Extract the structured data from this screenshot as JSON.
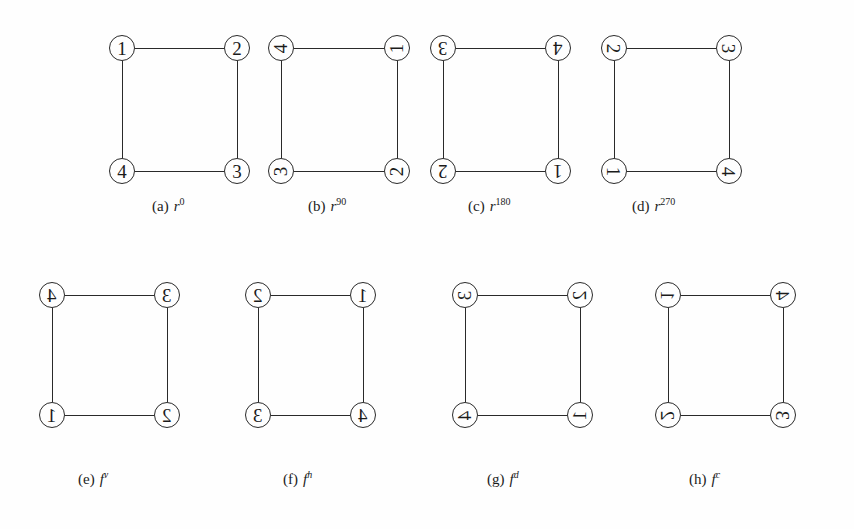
{
  "figure_set": {
    "description": "Eight labelled 4-cycle graphs showing the dihedral group D4 symmetries acting on a square's vertices",
    "node_diameter_px": 26,
    "line_color": "#2a2a2a",
    "background_color": "#fefefe",
    "text_color": "#1b1b1b"
  },
  "panels": [
    {
      "key": "a",
      "tag": "(a)",
      "symbol": "r",
      "exponent": "0",
      "exponent_italic": false,
      "orientation": "o-0",
      "nodes": {
        "tl": "1",
        "tr": "2",
        "bl": "4",
        "br": "3"
      }
    },
    {
      "key": "b",
      "tag": "(b)",
      "symbol": "r",
      "exponent": "90",
      "exponent_italic": false,
      "orientation": "o-90",
      "nodes": {
        "tl": "4",
        "tr": "1",
        "bl": "3",
        "br": "2"
      }
    },
    {
      "key": "c",
      "tag": "(c)",
      "symbol": "r",
      "exponent": "180",
      "exponent_italic": false,
      "orientation": "o-180",
      "nodes": {
        "tl": "3",
        "tr": "4",
        "bl": "2",
        "br": "1"
      }
    },
    {
      "key": "d",
      "tag": "(d)",
      "symbol": "r",
      "exponent": "270",
      "exponent_italic": false,
      "orientation": "o-270",
      "nodes": {
        "tl": "2",
        "tr": "3",
        "bl": "1",
        "br": "4"
      }
    },
    {
      "key": "e",
      "tag": "(e)",
      "symbol": "f",
      "exponent": "v",
      "exponent_italic": true,
      "orientation": "o-mx",
      "nodes": {
        "tl": "4",
        "tr": "3",
        "bl": "1",
        "br": "2"
      }
    },
    {
      "key": "f",
      "tag": "(f)",
      "symbol": "f",
      "exponent": "h",
      "exponent_italic": true,
      "orientation": "o-mx",
      "nodes": {
        "tl": "2",
        "tr": "1",
        "bl": "3",
        "br": "4"
      }
    },
    {
      "key": "g",
      "tag": "(g)",
      "symbol": "f",
      "exponent": "d",
      "exponent_italic": true,
      "orientation": "o-d",
      "nodes": {
        "tl": "3",
        "tr": "2",
        "bl": "4",
        "br": "1"
      }
    },
    {
      "key": "h",
      "tag": "(h)",
      "symbol": "f",
      "exponent": "c",
      "exponent_italic": true,
      "orientation": "o-c",
      "nodes": {
        "tl": "1",
        "tr": "4",
        "bl": "2",
        "br": "3"
      }
    }
  ]
}
